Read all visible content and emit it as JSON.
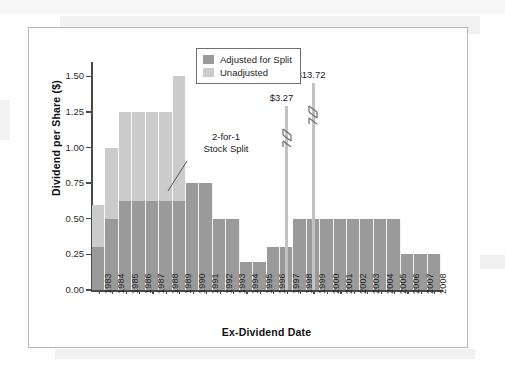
{
  "figure": {
    "legend": {
      "position": "top-center",
      "entries": [
        {
          "label": "Adjusted for Split",
          "color": "#9a9a9a"
        },
        {
          "label": "Unadjusted",
          "color": "#cbcbcb"
        }
      ]
    },
    "annotations": [
      {
        "name": "stock-split",
        "line1": "2-for-1",
        "line2": "Stock Split"
      },
      {
        "name": "spike-1997",
        "label": "$3.27"
      },
      {
        "name": "spike-1999",
        "label": "$13.72"
      }
    ]
  },
  "chart_data": {
    "type": "bar",
    "title": "",
    "xlabel": "Ex-Dividend Date",
    "ylabel": "Dividend per Share ($)",
    "ylim": [
      0.0,
      1.6
    ],
    "yticks": [
      "0.00",
      "0.25",
      "0.50",
      "0.75",
      "1.00",
      "1.25",
      "1.50"
    ],
    "ytick_values": [
      0.0,
      0.25,
      0.5,
      0.75,
      1.0,
      1.25,
      1.5
    ],
    "grid": false,
    "categories": [
      "1983",
      "1984",
      "1985",
      "1986",
      "1987",
      "1988",
      "1989",
      "1990",
      "1991",
      "1992",
      "1993",
      "1994",
      "1995",
      "1996",
      "1997",
      "1998",
      "1999",
      "2000",
      "2001",
      "2002",
      "2003",
      "2004",
      "2005",
      "2006",
      "2007",
      "2008"
    ],
    "series": [
      {
        "name": "Unadjusted",
        "color": "#cbcbcb",
        "values": [
          0.6,
          1.0,
          1.25,
          1.25,
          1.25,
          1.25,
          1.5,
          0.75,
          0.75,
          0.5,
          0.5,
          0.2,
          0.2,
          0.3,
          0.3,
          0.5,
          0.5,
          0.5,
          0.5,
          0.5,
          0.5,
          0.5,
          0.5,
          0.25,
          0.25,
          0.25
        ]
      },
      {
        "name": "Adjusted for Split",
        "color": "#9a9a9a",
        "values": [
          0.3,
          0.5,
          0.625,
          0.625,
          0.625,
          0.625,
          0.625,
          0.75,
          0.75,
          0.5,
          0.5,
          0.2,
          0.2,
          0.3,
          0.3,
          0.5,
          0.5,
          0.5,
          0.5,
          0.5,
          0.5,
          0.5,
          0.5,
          0.25,
          0.25,
          0.25
        ]
      }
    ],
    "spikes": [
      {
        "category": "1997",
        "label": "$3.27",
        "value": 3.27,
        "truncated": true
      },
      {
        "category": "1999",
        "label": "$13.72",
        "value": 13.72,
        "truncated": true
      }
    ]
  }
}
